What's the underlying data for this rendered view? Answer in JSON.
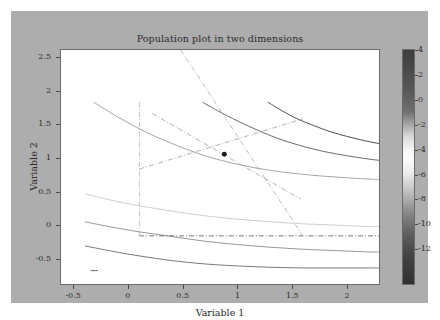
{
  "figure": {
    "background_color": "#adadad",
    "axes_background_color": "#ffffff",
    "title": "Population plot in two dimensions"
  },
  "axis": {
    "xlabel": "Variable 1",
    "ylabel": "Variable 2",
    "xticks": [
      "-0.5",
      "0",
      "0.5",
      "1",
      "1.5",
      "2"
    ],
    "yticks": [
      "2.5",
      "2",
      "1.5",
      "1",
      "0.5",
      "0",
      "-0.5"
    ]
  },
  "colorbar": {
    "ticks": [
      "4",
      "2",
      "0",
      "-2",
      "-4",
      "-6",
      "-8",
      "-10",
      "-12"
    ],
    "vmin": -14,
    "vmax": 5,
    "orientation": "vertical"
  },
  "chart_data": {
    "type": "line",
    "title": "Population plot in two dimensions",
    "xlabel": "Variable 1",
    "ylabel": "Variable 2",
    "xlim": [
      -0.72,
      2.2
    ],
    "ylim": [
      -0.72,
      2.78
    ],
    "xticks": [
      -0.5,
      0,
      0.5,
      1,
      1.5,
      2
    ],
    "yticks": [
      2.5,
      2,
      1.5,
      1,
      0.5,
      0,
      -0.5
    ],
    "grid": false,
    "legend": null,
    "colorbar": {
      "ticks": [
        4,
        2,
        0,
        -2,
        -4,
        -6,
        -8,
        -10,
        -12
      ],
      "vmin": -14,
      "vmax": 5
    },
    "contours": [
      {
        "level": 4,
        "color": "#3a3a3a",
        "points": [
          [
            1.18,
            2.0
          ],
          [
            1.3,
            1.88
          ],
          [
            1.45,
            1.75
          ],
          [
            1.6,
            1.65
          ],
          [
            1.75,
            1.56
          ],
          [
            1.9,
            1.49
          ],
          [
            2.05,
            1.43
          ],
          [
            2.2,
            1.38
          ]
        ]
      },
      {
        "level": 2,
        "color": "#5a5a5a",
        "points": [
          [
            0.58,
            2.0
          ],
          [
            0.72,
            1.87
          ],
          [
            0.9,
            1.72
          ],
          [
            1.1,
            1.57
          ],
          [
            1.3,
            1.44
          ],
          [
            1.5,
            1.34
          ],
          [
            1.7,
            1.26
          ],
          [
            1.9,
            1.2
          ],
          [
            2.1,
            1.15
          ],
          [
            2.2,
            1.13
          ]
        ]
      },
      {
        "level": 0,
        "color": "#9a9a9a",
        "points": [
          [
            -0.42,
            2.0
          ],
          [
            -0.2,
            1.78
          ],
          [
            0.05,
            1.56
          ],
          [
            0.3,
            1.38
          ],
          [
            0.6,
            1.2
          ],
          [
            0.9,
            1.07
          ],
          [
            1.2,
            0.98
          ],
          [
            1.5,
            0.92
          ],
          [
            1.8,
            0.88
          ],
          [
            2.1,
            0.85
          ],
          [
            2.2,
            0.84
          ]
        ]
      },
      {
        "level": -2,
        "color": "#c8c8c8",
        "points": [
          [
            -0.5,
            0.63
          ],
          [
            -0.25,
            0.53
          ],
          [
            0.0,
            0.45
          ],
          [
            0.3,
            0.37
          ],
          [
            0.6,
            0.3
          ],
          [
            0.9,
            0.25
          ],
          [
            1.2,
            0.21
          ],
          [
            1.5,
            0.18
          ],
          [
            1.8,
            0.16
          ],
          [
            2.1,
            0.14
          ],
          [
            2.2,
            0.14
          ]
        ]
      },
      {
        "level": -6,
        "color": "#8a8a8a",
        "points": [
          [
            -0.5,
            0.21
          ],
          [
            -0.25,
            0.13
          ],
          [
            0.0,
            0.06
          ],
          [
            0.3,
            -0.01
          ],
          [
            0.6,
            -0.08
          ],
          [
            0.9,
            -0.13
          ],
          [
            1.2,
            -0.17
          ],
          [
            1.5,
            -0.2
          ],
          [
            1.8,
            -0.22
          ],
          [
            2.1,
            -0.24
          ],
          [
            2.2,
            -0.24
          ]
        ]
      },
      {
        "level": -9,
        "color": "#6a6a6a",
        "points": [
          [
            -0.5,
            -0.15
          ],
          [
            -0.25,
            -0.23
          ],
          [
            0.0,
            -0.3
          ],
          [
            0.3,
            -0.37
          ],
          [
            0.6,
            -0.42
          ],
          [
            0.9,
            -0.45
          ],
          [
            1.2,
            -0.47
          ],
          [
            1.5,
            -0.48
          ],
          [
            1.8,
            -0.48
          ],
          [
            2.1,
            -0.48
          ],
          [
            2.2,
            -0.48
          ]
        ]
      },
      {
        "level": -12,
        "color": "#5a5a5a",
        "points": [
          [
            -0.45,
            -0.52
          ],
          [
            -0.38,
            -0.52
          ]
        ]
      }
    ],
    "constraint_lines": [
      {
        "name": "vertical-bound-x0",
        "style": "dashdot",
        "color": "#b0b0b0",
        "points": [
          [
            0.0,
            2.0
          ],
          [
            0.0,
            0.0
          ]
        ]
      },
      {
        "name": "horizontal-bound-y0",
        "style": "dashdot",
        "color": "#555555",
        "points": [
          [
            0.0,
            0.0
          ],
          [
            1.5,
            0.0
          ],
          [
            2.2,
            0.0
          ]
        ]
      },
      {
        "name": "constraint-steep-descending",
        "style": "dashdot",
        "color": "#a8a8a8",
        "points": [
          [
            0.38,
            2.78
          ],
          [
            1.5,
            0.0
          ]
        ]
      },
      {
        "name": "constraint-diagonal-upward",
        "style": "dashdot",
        "color": "#9c9c9c",
        "points": [
          [
            0.0,
            1.0
          ],
          [
            1.5,
            1.75
          ]
        ]
      },
      {
        "name": "constraint-diagonal-downward",
        "style": "dashdot",
        "color": "#9c9c9c",
        "points": [
          [
            0.12,
            1.83
          ],
          [
            1.48,
            0.55
          ]
        ]
      }
    ],
    "markers": [
      {
        "name": "optimum-point",
        "x": 0.78,
        "y": 1.22,
        "color": "#1a1a1a",
        "size": 5
      }
    ]
  }
}
